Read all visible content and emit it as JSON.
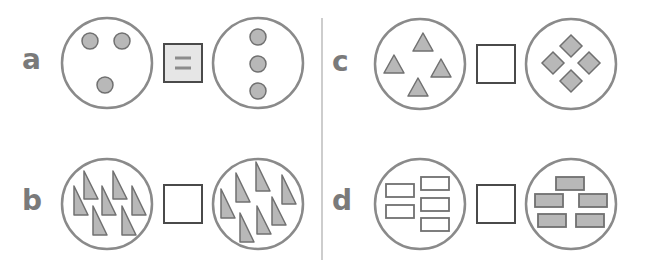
{
  "colors": {
    "circle_stroke": "#8a8a8a",
    "shape_fill": "#b8b8b8",
    "shape_stroke": "#707070",
    "box_stroke": "#4a4a4a",
    "equals_box_fill": "#e6e6e6",
    "equals_sign": "#8c8c8c",
    "divider": "#bdbdbd",
    "label": "#7a7a7a"
  },
  "problems": [
    {
      "id": "a",
      "label": "a",
      "left": "3 circles (dots)",
      "right": "3 circles (dots)",
      "answer_box": "="
    },
    {
      "id": "b",
      "label": "b",
      "left": "7 right triangles",
      "right": "7 right triangles",
      "answer_box": ""
    },
    {
      "id": "c",
      "label": "c",
      "left": "4 triangles",
      "right": "4 diamonds",
      "answer_box": ""
    },
    {
      "id": "d",
      "label": "d",
      "left": "5 empty rectangles",
      "right": "5 filled rectangles",
      "answer_box": ""
    }
  ]
}
